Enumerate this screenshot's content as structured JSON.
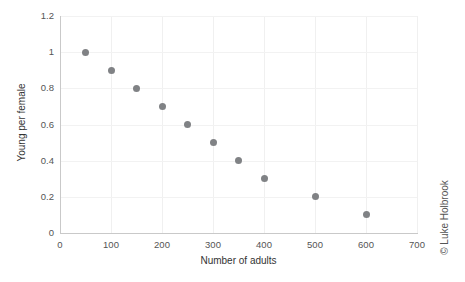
{
  "chart_data": {
    "type": "scatter",
    "title": "",
    "xlabel": "Number of adults",
    "ylabel": "Young per female",
    "xlim": [
      0,
      700
    ],
    "ylim": [
      0,
      1.2
    ],
    "xticks": [
      "0",
      "100",
      "200",
      "300",
      "400",
      "500",
      "600",
      "700"
    ],
    "xtick_values": [
      0,
      100,
      200,
      300,
      400,
      500,
      600,
      700
    ],
    "yticks": [
      "0",
      "0.2",
      "0.4",
      "0.6",
      "0.8",
      "1",
      "1.2"
    ],
    "ytick_values": [
      0,
      0.2,
      0.4,
      0.6,
      0.8,
      1,
      1.2
    ],
    "grid": true,
    "legend": null,
    "series": [
      {
        "name": "",
        "marker": "circle",
        "color": "#808285",
        "points": [
          {
            "x": 50,
            "y": 1.0
          },
          {
            "x": 100,
            "y": 0.9
          },
          {
            "x": 150,
            "y": 0.8
          },
          {
            "x": 200,
            "y": 0.7
          },
          {
            "x": 250,
            "y": 0.6
          },
          {
            "x": 300,
            "y": 0.5
          },
          {
            "x": 350,
            "y": 0.4
          },
          {
            "x": 400,
            "y": 0.3
          },
          {
            "x": 500,
            "y": 0.2
          },
          {
            "x": 600,
            "y": 0.1
          }
        ]
      }
    ]
  },
  "annotations": {
    "copyright": "© Luke Holbrook"
  },
  "colors": {
    "marker": "#808285",
    "axis": "#c9c9c9",
    "grid": "#f0f0f0",
    "text": "#333333",
    "tick_text": "#555555",
    "background": "#ffffff"
  }
}
